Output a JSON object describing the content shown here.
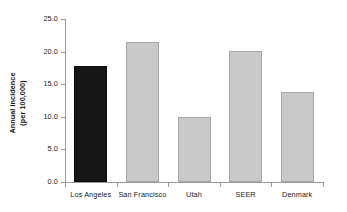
{
  "chart_data": {
    "type": "bar",
    "title": "",
    "xlabel": "",
    "ylabel": "Annual incidence\n(per 100,000)",
    "categories": [
      "Los Angeles",
      "San Francisco",
      "Utah",
      "SEER",
      "Denmark"
    ],
    "values": [
      17.8,
      21.5,
      10.0,
      20.1,
      13.8
    ],
    "ylim": [
      0.0,
      25.0
    ],
    "ytick_labels": [
      "0.0",
      "5.0",
      "10.0",
      "15.0",
      "20.0",
      "25.0"
    ],
    "ytick_values": [
      0.0,
      5.0,
      10.0,
      15.0,
      20.0,
      25.0
    ],
    "grid": false,
    "legend": false,
    "bar_colors": [
      "#161616",
      "#c9c9c9",
      "#c9c9c9",
      "#c9c9c9",
      "#c9c9c9"
    ],
    "highlight_category": "Los Angeles",
    "axis_color": "#9a9a9a",
    "text_color": "#1a1a1a"
  }
}
